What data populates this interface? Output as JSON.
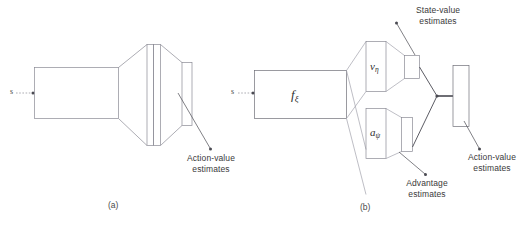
{
  "figure": {
    "background_color": "#ffffff",
    "stroke_color": "#7c7c87",
    "stroke_color_dark": "#4a4a52",
    "text_color": "#3a3a3a",
    "panels": [
      {
        "id": "a",
        "caption": "(a)",
        "input_label": "s",
        "annotations": [
          {
            "id": "action-value",
            "line1": "Action-value",
            "line2": "estimates"
          }
        ]
      },
      {
        "id": "b",
        "caption": "(b)",
        "input_label": "s",
        "blocks": [
          {
            "id": "trunk",
            "symbol": "f",
            "subscript": "ξ"
          },
          {
            "id": "value-stream",
            "symbol": "v",
            "subscript": "η"
          },
          {
            "id": "advantage-stream",
            "symbol": "a",
            "subscript": "ψ"
          }
        ],
        "annotations": [
          {
            "id": "state-value",
            "line1": "State-value",
            "line2": "estimate"
          },
          {
            "id": "advantage",
            "line1": "Advantage",
            "line2": "estimates"
          },
          {
            "id": "action-value",
            "line1": "Action-value",
            "line2": "estimates"
          }
        ]
      }
    ]
  }
}
